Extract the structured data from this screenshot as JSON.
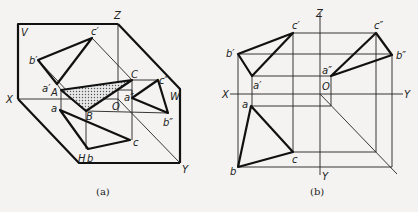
{
  "figure_a": {
    "caption": "(a)",
    "labels": {
      "V": "V",
      "Z": "Z",
      "X": "X",
      "W": "W",
      "H": "H",
      "Y": "Y",
      "O": "O",
      "a_prime": "a′",
      "b_prime": "b′",
      "c_prime": "c′",
      "a_dprime": "a″",
      "b_dprime": "b″",
      "c_dprime": "c″",
      "a": "a",
      "b": "b",
      "c": "c",
      "A": "A",
      "B": "B",
      "C": "C"
    }
  },
  "figure_b": {
    "caption": "(b)",
    "labels": {
      "Z": "Z",
      "X": "X",
      "Y_right": "Y",
      "Y_bottom": "Y",
      "O": "O",
      "a_prime": "a′",
      "b_prime": "b′",
      "c_prime": "c′",
      "a_dprime": "a″",
      "b_dprime": "b″",
      "c_dprime": "c″",
      "a": "a",
      "b": "b",
      "c": "c"
    }
  },
  "colors": {
    "line": "#111111",
    "background": "#f4f3f1",
    "hatch": "#555555"
  }
}
